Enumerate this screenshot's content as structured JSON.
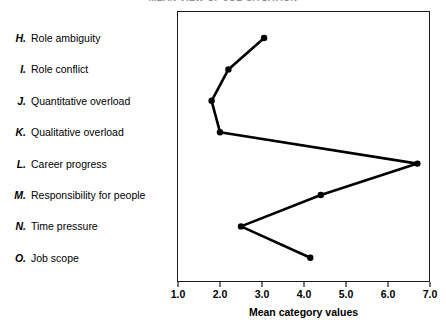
{
  "chart_data": {
    "type": "line",
    "title": "MEAN VIEW OF JOB SITUATION",
    "xlabel": "Mean category values",
    "ylabel": "",
    "xlim": [
      1.0,
      7.0
    ],
    "grid": false,
    "legend": "left-category-list",
    "orientation": "horizontal-categories-on-y",
    "xticks": [
      "1.0",
      "2.0",
      "3.0",
      "4.0",
      "5.0",
      "6.0",
      "7.0"
    ],
    "xtick_values": [
      1.0,
      2.0,
      3.0,
      4.0,
      5.0,
      6.0,
      7.0
    ],
    "categories": [
      "Role ambiguity",
      "Role conflict",
      "Quantitative overload",
      "Qualitative overload",
      "Career progress",
      "Responsibility for people",
      "Time pressure",
      "Job scope"
    ],
    "category_keys": [
      "H.",
      "I.",
      "J.",
      "K.",
      "L.",
      "M.",
      "N.",
      "O."
    ],
    "values": [
      3.05,
      2.2,
      1.8,
      2.0,
      6.7,
      4.4,
      2.5,
      4.15
    ],
    "points": [
      {
        "key": "H.",
        "label": "Role ambiguity",
        "value": 3.05
      },
      {
        "key": "I.",
        "label": "Role conflict",
        "value": 2.2
      },
      {
        "key": "J.",
        "label": "Quantitative overload",
        "value": 1.8
      },
      {
        "key": "K.",
        "label": "Qualitative overload",
        "value": 2.0
      },
      {
        "key": "L.",
        "label": "Career progress",
        "value": 6.7
      },
      {
        "key": "M.",
        "label": "Responsibility for people",
        "value": 4.4
      },
      {
        "key": "N.",
        "label": "Time pressure",
        "value": 2.5
      },
      {
        "key": "O.",
        "label": "Job scope",
        "value": 4.15
      }
    ],
    "series_color": "#000000",
    "frame_color": "#1a1a1a",
    "background_color": "#ffffff"
  }
}
